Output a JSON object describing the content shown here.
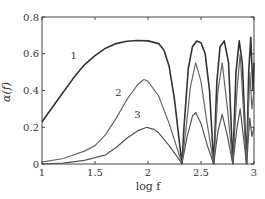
{
  "chart_data": {
    "type": "line",
    "title": "",
    "xlabel": "log f",
    "ylabel": "α(f)",
    "xlim": [
      1,
      3
    ],
    "ylim": [
      0,
      0.8
    ],
    "xticks": [
      1,
      1.5,
      2,
      2.5,
      3
    ],
    "xtick_labels": [
      "1",
      "1.5",
      "2",
      "2.5",
      "3"
    ],
    "yticks": [
      0,
      0.2,
      0.4,
      0.6,
      0.8
    ],
    "ytick_labels": [
      "0",
      "0.2",
      "0.4",
      "0.6",
      "0.8"
    ],
    "grid": false,
    "legend": "inline curve labels",
    "series": [
      {
        "name": "1",
        "label_pos": [
          1.3,
          0.57
        ],
        "color": "#333333",
        "x": [
          1.0,
          1.1,
          1.2,
          1.3,
          1.4,
          1.5,
          1.6,
          1.7,
          1.8,
          1.9,
          2.0,
          2.1,
          2.15,
          2.2,
          2.25,
          2.3,
          2.32,
          2.34,
          2.38,
          2.42,
          2.46,
          2.5,
          2.54,
          2.58,
          2.62,
          2.65,
          2.68,
          2.72,
          2.76,
          2.8,
          2.83,
          2.86,
          2.89,
          2.93,
          2.95,
          2.97,
          2.99,
          3.0
        ],
        "y": [
          0.23,
          0.31,
          0.39,
          0.47,
          0.54,
          0.59,
          0.63,
          0.655,
          0.668,
          0.672,
          0.67,
          0.655,
          0.62,
          0.53,
          0.35,
          0.1,
          0.0,
          0.2,
          0.52,
          0.64,
          0.67,
          0.66,
          0.6,
          0.4,
          0.0,
          0.45,
          0.64,
          0.67,
          0.55,
          0.0,
          0.5,
          0.67,
          0.55,
          0.0,
          0.5,
          0.69,
          0.4,
          0.55
        ]
      },
      {
        "name": "2",
        "label_pos": [
          1.72,
          0.37
        ],
        "color": "#666666",
        "x": [
          1.0,
          1.2,
          1.4,
          1.5,
          1.6,
          1.7,
          1.8,
          1.9,
          1.96,
          2.0,
          2.1,
          2.2,
          2.3,
          2.32,
          2.36,
          2.4,
          2.45,
          2.5,
          2.55,
          2.62,
          2.66,
          2.7,
          2.75,
          2.8,
          2.84,
          2.87,
          2.9,
          2.93,
          2.96,
          2.98,
          3.0
        ],
        "y": [
          0.01,
          0.03,
          0.07,
          0.1,
          0.16,
          0.25,
          0.35,
          0.43,
          0.46,
          0.45,
          0.37,
          0.22,
          0.04,
          0.0,
          0.2,
          0.42,
          0.55,
          0.45,
          0.25,
          0.0,
          0.4,
          0.55,
          0.3,
          0.0,
          0.4,
          0.6,
          0.3,
          0.0,
          0.5,
          0.3,
          0.4
        ]
      },
      {
        "name": "3",
        "label_pos": [
          1.9,
          0.25
        ],
        "color": "#555555",
        "x": [
          1.0,
          1.2,
          1.4,
          1.6,
          1.7,
          1.8,
          1.9,
          1.99,
          2.05,
          2.1,
          2.2,
          2.3,
          2.32,
          2.37,
          2.42,
          2.45,
          2.5,
          2.56,
          2.62,
          2.66,
          2.7,
          2.75,
          2.8,
          2.84,
          2.87,
          2.9,
          2.93,
          2.96,
          2.98,
          3.0
        ],
        "y": [
          0.0,
          0.005,
          0.02,
          0.05,
          0.09,
          0.14,
          0.18,
          0.2,
          0.19,
          0.17,
          0.1,
          0.02,
          0.0,
          0.15,
          0.26,
          0.28,
          0.22,
          0.1,
          0.0,
          0.18,
          0.27,
          0.15,
          0.0,
          0.2,
          0.3,
          0.15,
          0.0,
          0.25,
          0.15,
          0.2
        ]
      }
    ]
  }
}
